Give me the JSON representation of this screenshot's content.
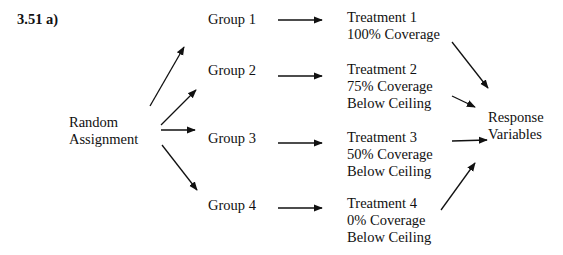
{
  "label": "3.51 a)",
  "start": {
    "line1": "Random",
    "line2": "Assignment"
  },
  "groups": [
    {
      "label": "Group 1"
    },
    {
      "label": "Group 2"
    },
    {
      "label": "Group 3"
    },
    {
      "label": "Group 4"
    }
  ],
  "treatments": [
    {
      "title": "Treatment 1",
      "coverage": "100% Coverage",
      "note": ""
    },
    {
      "title": "Treatment 2",
      "coverage": "75% Coverage",
      "note": "Below Ceiling"
    },
    {
      "title": "Treatment 3",
      "coverage": "50% Coverage",
      "note": "Below Ceiling"
    },
    {
      "title": "Treatment 4",
      "coverage": "0% Coverage",
      "note": "Below Ceiling"
    }
  ],
  "end": {
    "line1": "Response",
    "line2": "Variables"
  },
  "colors": {
    "ink": "#111111",
    "background": "#ffffff"
  }
}
